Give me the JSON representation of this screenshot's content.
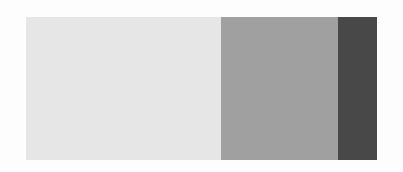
{
  "chart_data": {
    "type": "bar",
    "orientation": "horizontal-stacked",
    "title": "",
    "xlabel": "",
    "ylabel": "",
    "categories": [
      ""
    ],
    "series": [
      {
        "name": "segment-1",
        "values": [
          5
        ],
        "color": "#e6e6e6"
      },
      {
        "name": "segment-2",
        "values": [
          3
        ],
        "color": "#a0a0a0"
      },
      {
        "name": "segment-3",
        "values": [
          1
        ],
        "color": "#484848"
      }
    ],
    "proportions": [
      0.556,
      0.333,
      0.111
    ],
    "legend": null,
    "grid": false
  }
}
